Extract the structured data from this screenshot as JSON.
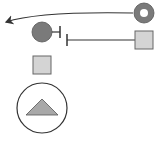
{
  "diagram": {
    "type": "pathway-glyph-diagram",
    "colors": {
      "background": "#ffffff",
      "stroke": "#333333",
      "dark_fill": "#7a7a7a",
      "light_fill": "#d4d4d4",
      "triangle_fill": "#a8a8a8"
    },
    "nodes": [
      {
        "id": "donut-node",
        "shape": "donut-circle",
        "label": ""
      },
      {
        "id": "dark-circle-node",
        "shape": "filled-circle",
        "label": ""
      },
      {
        "id": "square-node-right",
        "shape": "square",
        "label": ""
      },
      {
        "id": "square-node-left",
        "shape": "square",
        "label": ""
      },
      {
        "id": "triangle-in-circle-node",
        "shape": "triangle-in-circle",
        "label": ""
      }
    ],
    "edges": [
      {
        "from": "donut-node",
        "to": "left-edge",
        "type": "arrow"
      },
      {
        "from": "dark-circle-node",
        "type": "inhibition"
      },
      {
        "from": "square-node-right",
        "type": "inhibition"
      }
    ]
  }
}
